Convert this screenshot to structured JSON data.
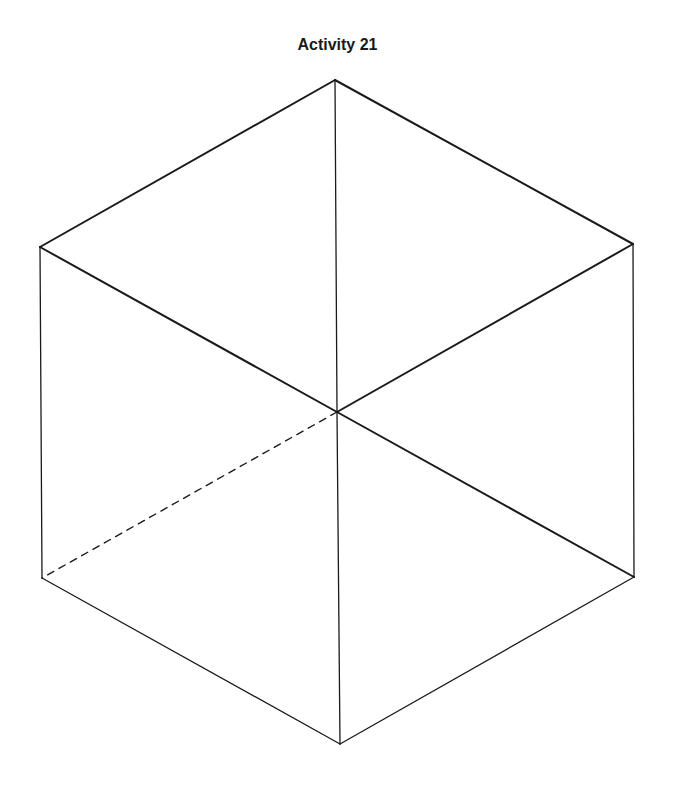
{
  "title": "Activity 21",
  "colors": {
    "stroke": "#1a1a1a",
    "background": "#ffffff"
  },
  "figure": {
    "type": "hexagon-cube-outline",
    "vertices": {
      "top": [
        335,
        80
      ],
      "upper_left": [
        40,
        247
      ],
      "upper_right": [
        633,
        244
      ],
      "center": [
        337,
        412
      ],
      "lower_left": [
        42,
        578
      ],
      "lower_right": [
        634,
        577
      ],
      "bottom": [
        340,
        744
      ]
    },
    "edges_solid": [
      [
        "top",
        "upper_left"
      ],
      [
        "top",
        "upper_right"
      ],
      [
        "upper_left",
        "center"
      ],
      [
        "upper_right",
        "center"
      ],
      [
        "top",
        "center"
      ],
      [
        "upper_left",
        "lower_left"
      ],
      [
        "upper_right",
        "lower_right"
      ],
      [
        "center",
        "lower_right"
      ],
      [
        "center",
        "bottom"
      ],
      [
        "lower_left",
        "bottom"
      ],
      [
        "lower_right",
        "bottom"
      ]
    ],
    "edges_dashed": [
      [
        "center",
        "lower_left"
      ]
    ]
  }
}
